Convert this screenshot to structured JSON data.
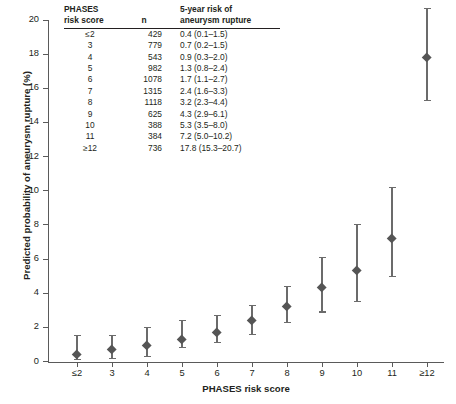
{
  "chart_data": {
    "type": "scatter",
    "title": "",
    "xlabel": "PHASES risk score",
    "ylabel": "Predicted probability of aneurysm rupture (%)",
    "categories": [
      "≤2",
      "3",
      "4",
      "5",
      "6",
      "7",
      "8",
      "9",
      "10",
      "11",
      "≥12"
    ],
    "values": [
      0.4,
      0.7,
      0.9,
      1.3,
      1.7,
      2.4,
      3.2,
      4.3,
      5.3,
      7.2,
      17.8
    ],
    "ci_low": [
      0.1,
      0.2,
      0.3,
      0.8,
      1.1,
      1.6,
      2.3,
      2.9,
      3.5,
      5.0,
      15.3
    ],
    "ci_high": [
      1.5,
      1.5,
      2.0,
      2.4,
      2.7,
      3.3,
      4.4,
      6.1,
      8.0,
      10.2,
      20.7
    ],
    "ylim": [
      0,
      20
    ],
    "yticks": [
      0,
      2,
      4,
      6,
      8,
      10,
      12,
      14,
      16,
      18,
      20
    ],
    "grid": false,
    "legend": "none",
    "marker": "diamond",
    "marker_color": "#555555",
    "errorbar_color": "#6b6b6b"
  },
  "table": {
    "headers": {
      "score_line1": "PHASES",
      "score_line2": "risk score",
      "n": "n",
      "risk_line1": "5-year risk of",
      "risk_line2": "aneurysm rupture"
    },
    "rows": [
      {
        "score": "≤2",
        "n": "429",
        "risk": "0.4 (0.1–1.5)"
      },
      {
        "score": "3",
        "n": "779",
        "risk": "0.7 (0.2–1.5)"
      },
      {
        "score": "4",
        "n": "543",
        "risk": "0.9 (0.3–2.0)"
      },
      {
        "score": "5",
        "n": "982",
        "risk": "1.3 (0.8–2.4)"
      },
      {
        "score": "6",
        "n": "1078",
        "risk": "1.7 (1.1–2.7)"
      },
      {
        "score": "7",
        "n": "1315",
        "risk": "2.4 (1.6–3.3)"
      },
      {
        "score": "8",
        "n": "1118",
        "risk": "3.2 (2.3–4.4)"
      },
      {
        "score": "9",
        "n": "625",
        "risk": "4.3 (2.9–6.1)"
      },
      {
        "score": "10",
        "n": "388",
        "risk": "5.3 (3.5–8.0)"
      },
      {
        "score": "11",
        "n": "384",
        "risk": "7.2 (5.0–10.2)"
      },
      {
        "score": "≥12",
        "n": "736",
        "risk": "17.8 (15.3–20.7)"
      }
    ]
  }
}
